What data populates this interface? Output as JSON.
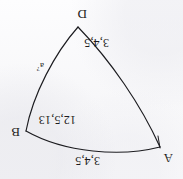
{
  "figure": {
    "kind": "hand-drawn-geometry-scan",
    "orientation": "rotated-180",
    "background_color": "#fbfbfc",
    "ink_color": "#1c1c20",
    "vertices": [
      {
        "name": "A",
        "label": "A",
        "x": 23,
        "y": 32
      },
      {
        "name": "B",
        "label": "B",
        "x": 157,
        "y": 48
      },
      {
        "name": "D",
        "label": "D",
        "x": 105,
        "y": 152
      }
    ],
    "vertex_labels": [
      {
        "id": "vertex-a",
        "text": "A",
        "x": 10,
        "y": 14
      },
      {
        "id": "vertex-b",
        "text": "B",
        "x": 163,
        "y": 40
      },
      {
        "id": "vertex-d",
        "text": "D",
        "x": 96,
        "y": 158
      }
    ],
    "edges": [
      {
        "name": "edge-ab",
        "from": "A",
        "to": "B",
        "label": "3,4,5"
      },
      {
        "name": "edge-bd",
        "from": "B",
        "to": "D",
        "label": "12,5,13"
      },
      {
        "name": "edge-da",
        "from": "D",
        "to": "A",
        "label": "3,4,5"
      }
    ],
    "edge_labels": [
      {
        "id": "edge-label-ab",
        "text": "3,4,5",
        "x": 83,
        "y": 12
      },
      {
        "id": "edge-label-bd",
        "text": "12,5,13",
        "x": 107,
        "y": 53
      },
      {
        "id": "edge-label-da",
        "text": "3,4,5",
        "x": 74,
        "y": 130
      }
    ],
    "annotations": [
      {
        "id": "annotation-a-question",
        "base": "a",
        "superscript": "?",
        "text": "a?",
        "x": 139,
        "y": 107
      }
    ]
  }
}
